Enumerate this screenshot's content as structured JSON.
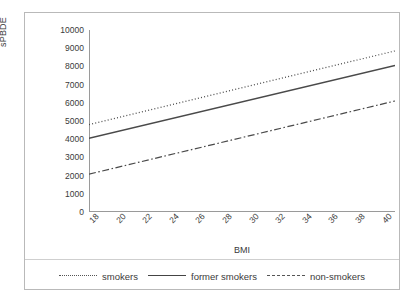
{
  "chart_data": {
    "type": "line",
    "title": "",
    "xlabel": "BMI",
    "ylabel": "sPBDE",
    "xlim": [
      18,
      41
    ],
    "ylim": [
      0,
      10000
    ],
    "grid": false,
    "legend_position": "bottom",
    "x_ticks": [
      "18",
      "20",
      "22",
      "24",
      "26",
      "28",
      "30",
      "32",
      "34",
      "36",
      "38",
      "40"
    ],
    "y_ticks": [
      "0",
      "1000",
      "2000",
      "3000",
      "4000",
      "5000",
      "6000",
      "7000",
      "8000",
      "9000",
      "10000"
    ],
    "x": [
      18,
      41
    ],
    "series": [
      {
        "name": "smokers",
        "style": "dotted",
        "values": [
          4800,
          8850
        ]
      },
      {
        "name": "former smokers",
        "style": "solid",
        "values": [
          4050,
          8050
        ]
      },
      {
        "name": "non-smokers",
        "style": "dash-dot",
        "values": [
          2080,
          6100
        ]
      }
    ]
  },
  "axes": {
    "y_title": "sPBDE",
    "x_title": "BMI"
  },
  "legend": {
    "items": [
      {
        "label": "smokers"
      },
      {
        "label": "former smokers"
      },
      {
        "label": "non-smokers"
      }
    ]
  },
  "colors": {
    "line": "#4a4a4a",
    "axis": "#9a9a9a",
    "border": "#b9b9b9",
    "text": "#3a3a3a",
    "background": "#ffffff"
  }
}
